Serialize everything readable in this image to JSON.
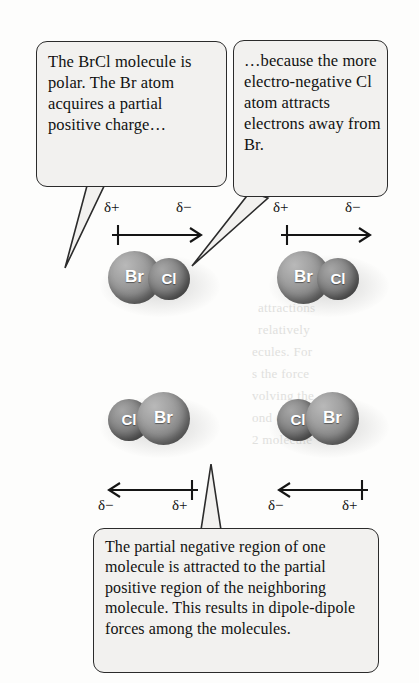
{
  "figure": {
    "background_color": "#fdfdfc",
    "box_fill_color": "#f2f1ef",
    "box_border_color": "#2b2b2b",
    "atom_br_color": "#8a8a8a",
    "atom_cl_color": "#767676"
  },
  "callouts": {
    "left": {
      "text": "The BrCl molecule is polar. The Br atom acquires a partial positive charge…"
    },
    "right": {
      "text": "…because the more electro-negative Cl atom attracts electrons away from Br."
    },
    "bottom": {
      "text": "The partial negative region of one molecule is attracted to the partial positive region of the neighboring molecule. This results in dipole-dipole forces among the molecules."
    }
  },
  "labels": {
    "delta_plus": "δ+",
    "delta_minus": "δ−"
  },
  "atoms": {
    "br": "Br",
    "cl": "Cl"
  },
  "molecules": [
    {
      "id": "top-left",
      "left_atom": "Br",
      "right_atom": "Cl",
      "dipole_direction": "right",
      "tail_charge": "δ+",
      "head_charge": "δ−"
    },
    {
      "id": "top-right",
      "left_atom": "Br",
      "right_atom": "Cl",
      "dipole_direction": "right",
      "tail_charge": "δ+",
      "head_charge": "δ−"
    },
    {
      "id": "bottom-left",
      "left_atom": "Cl",
      "right_atom": "Br",
      "dipole_direction": "left",
      "tail_charge": "δ+",
      "head_charge": "δ−"
    },
    {
      "id": "bottom-right",
      "left_atom": "Cl",
      "right_atom": "Br",
      "dipole_direction": "left",
      "tail_charge": "δ+",
      "head_charge": "δ−"
    }
  ],
  "ghost_text": {
    "line1": "ed Forces",
    "line2": "attractions",
    "line3": "relatively",
    "line4": "ecules. For",
    "line5": "s the force",
    "line6": "volving the",
    "line7": "ond energy",
    "line8": "2 molecule"
  }
}
